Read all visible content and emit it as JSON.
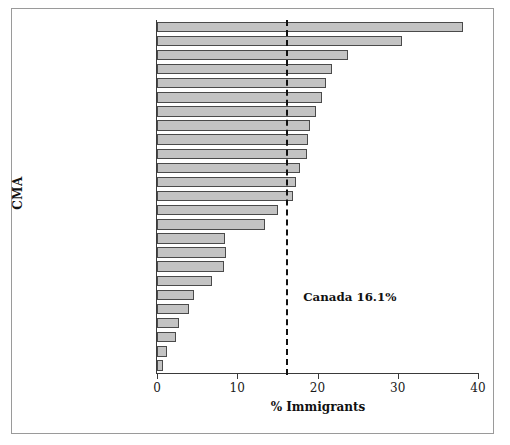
{
  "chart_data": {
    "type": "bar",
    "orientation": "horizontal",
    "title": "",
    "xlabel": "% Immigrants",
    "ylabel": "CMA",
    "xlim": [
      0,
      40
    ],
    "xticks": [
      0,
      10,
      20,
      30,
      40
    ],
    "grid": false,
    "legend": null,
    "bar_color": "#c3c3c3",
    "bar_edge_color": "#4a4a4a",
    "categories": [
      "Toronto",
      "Vancouver",
      "Hamilton",
      "Kitchener",
      "Windsor",
      "Calgary",
      "Victoria",
      "St. Catharines-Niagara",
      "London",
      "Edmonton",
      "Winnipeg",
      "Oshawa",
      "Montreal",
      "Ottawa-Hull",
      "Thunder Bay",
      "Regina",
      "Saskatoon",
      "Sudbury",
      "Halifax",
      "Saint John",
      "Sherbrooke",
      "St. John's",
      "Quebec",
      "Trois-Rivières",
      "Chicoutimi-Jonquière"
    ],
    "values": [
      38.1,
      30.5,
      23.8,
      21.8,
      21.0,
      20.6,
      19.8,
      19.1,
      18.8,
      18.7,
      17.8,
      17.3,
      16.9,
      15.1,
      13.4,
      8.5,
      8.6,
      8.4,
      6.8,
      4.6,
      4.0,
      2.7,
      2.4,
      1.2,
      0.7
    ],
    "annotations": [
      {
        "name": "canada-reference",
        "label": "Canada 16.1%",
        "value": 16.1,
        "style": "dashed-vline",
        "color": "#111111"
      }
    ]
  }
}
